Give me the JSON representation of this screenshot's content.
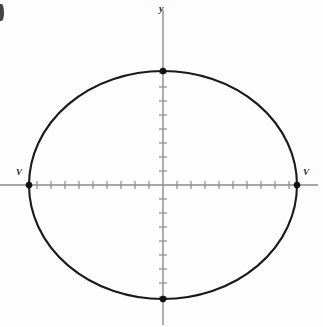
{
  "figure": {
    "kind": "ellipse-graph",
    "background_color": "#fdfdfd",
    "width": 323,
    "height": 327,
    "corner_artifact": {
      "present": true,
      "description": "partial cut-off glyph at left edge"
    }
  },
  "axes": {
    "origin": {
      "x": 163,
      "y": 185
    },
    "x_axis": {
      "label": "",
      "color": "#8a8a8a",
      "start_x": 0,
      "end_x": 318,
      "tick_spacing": 14,
      "ticks_per_side": 9,
      "tick_half_length": 4
    },
    "y_axis": {
      "label": "y",
      "color": "#8a8a8a",
      "start_y": 10,
      "end_y": 325,
      "tick_spacing": 14,
      "ticks_per_side": 8,
      "tick_half_length": 4
    }
  },
  "chart_data": {
    "type": "line",
    "title": "",
    "subtitle": "",
    "xlabel": "",
    "ylabel": "y",
    "curve": "ellipse",
    "equation": "x^2/a^2 + y^2/b^2 = 1",
    "center": {
      "x": 0,
      "y": 0
    },
    "semi_major_axis_px": 134,
    "semi_minor_axis_px": 114,
    "major_axis_orientation": "horizontal",
    "xlim": [
      -163,
      155
    ],
    "ylim": [
      -140,
      175
    ],
    "grid": false,
    "legend": null,
    "stroke_color": "#1a1a1a",
    "vertices": [
      {
        "name": "left-vertex",
        "label": "V",
        "px": {
          "x": 29,
          "y": 185
        }
      },
      {
        "name": "right-vertex",
        "label": "V",
        "px": {
          "x": 297,
          "y": 185
        }
      },
      {
        "name": "top-covertex",
        "label": "",
        "px": {
          "x": 163,
          "y": 71
        }
      },
      {
        "name": "bottom-covertex",
        "label": "",
        "px": {
          "x": 163,
          "y": 299
        }
      }
    ],
    "annotations": [
      {
        "text": "y",
        "role": "y-axis-label",
        "px": {
          "x": 163,
          "y": 10
        }
      },
      {
        "text": "V",
        "role": "left-vertex-label",
        "px": {
          "x": 20,
          "y": 173
        }
      },
      {
        "text": "V",
        "role": "right-vertex-label",
        "px": {
          "x": 306,
          "y": 173
        }
      }
    ]
  },
  "labels": {
    "y_axis": "y",
    "vertex_left": "V",
    "vertex_right": "V"
  }
}
